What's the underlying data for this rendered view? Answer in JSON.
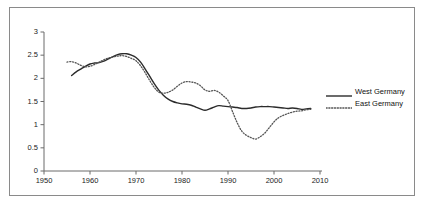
{
  "chart_data": {
    "type": "line",
    "title": "",
    "subtitle": "",
    "xlabel": "",
    "ylabel": "",
    "xlim": [
      1950,
      2010
    ],
    "ylim": [
      0,
      3
    ],
    "grid": false,
    "legend_position": "right",
    "xticks": [
      "1950",
      "1960",
      "1970",
      "1980",
      "1990",
      "2000",
      "2010"
    ],
    "xtick_values": [
      1950,
      1960,
      1970,
      1980,
      1990,
      2000,
      2010
    ],
    "yticks": [
      "0",
      "0.5",
      "1",
      "1.5",
      "2",
      "2.5",
      "3"
    ],
    "ytick_values": [
      0,
      0.5,
      1,
      1.5,
      2,
      2.5,
      3
    ],
    "series": [
      {
        "name": "West Germany",
        "style": "solid",
        "color": "#2b2b2b",
        "x": [
          1956,
          1957,
          1958,
          1959,
          1960,
          1961,
          1962,
          1963,
          1964,
          1965,
          1966,
          1967,
          1968,
          1969,
          1970,
          1971,
          1972,
          1973,
          1974,
          1975,
          1976,
          1977,
          1978,
          1979,
          1980,
          1981,
          1982,
          1983,
          1984,
          1985,
          1986,
          1987,
          1988,
          1989,
          1990,
          1991,
          1992,
          1993,
          1994,
          1995,
          1996,
          1997,
          1998,
          1999,
          2000,
          2001,
          2002,
          2003,
          2004,
          2005,
          2006,
          2007,
          2008
        ],
        "values": [
          2.06,
          2.14,
          2.2,
          2.26,
          2.31,
          2.33,
          2.34,
          2.37,
          2.42,
          2.47,
          2.51,
          2.53,
          2.53,
          2.5,
          2.45,
          2.35,
          2.2,
          2.04,
          1.88,
          1.74,
          1.63,
          1.55,
          1.5,
          1.47,
          1.45,
          1.44,
          1.42,
          1.38,
          1.34,
          1.31,
          1.34,
          1.38,
          1.41,
          1.4,
          1.39,
          1.38,
          1.37,
          1.35,
          1.35,
          1.36,
          1.38,
          1.39,
          1.39,
          1.39,
          1.38,
          1.37,
          1.36,
          1.35,
          1.36,
          1.35,
          1.33,
          1.34,
          1.35
        ]
      },
      {
        "name": "East Germany",
        "style": "dotted",
        "color": "#555555",
        "x": [
          1955,
          1956,
          1957,
          1958,
          1959,
          1960,
          1961,
          1962,
          1963,
          1964,
          1965,
          1966,
          1967,
          1968,
          1969,
          1970,
          1971,
          1972,
          1973,
          1974,
          1975,
          1976,
          1977,
          1978,
          1979,
          1980,
          1981,
          1982,
          1983,
          1984,
          1985,
          1986,
          1987,
          1988,
          1989,
          1990,
          1991,
          1992,
          1993,
          1994,
          1995,
          1996,
          1997,
          1998,
          1999,
          2000,
          2001,
          2002,
          2003,
          2004,
          2005,
          2006,
          2007,
          2008
        ],
        "values": [
          2.35,
          2.36,
          2.33,
          2.28,
          2.25,
          2.26,
          2.3,
          2.35,
          2.4,
          2.44,
          2.46,
          2.48,
          2.49,
          2.47,
          2.43,
          2.38,
          2.27,
          2.12,
          1.95,
          1.8,
          1.7,
          1.68,
          1.7,
          1.75,
          1.83,
          1.9,
          1.93,
          1.92,
          1.9,
          1.84,
          1.75,
          1.72,
          1.74,
          1.7,
          1.62,
          1.52,
          1.28,
          1.04,
          0.86,
          0.77,
          0.72,
          0.69,
          0.74,
          0.82,
          0.94,
          1.06,
          1.15,
          1.2,
          1.24,
          1.27,
          1.29,
          1.3,
          1.32,
          1.33
        ]
      }
    ]
  },
  "legend": {
    "items": [
      {
        "label": "West Germany",
        "style": "solid"
      },
      {
        "label": "East Germany",
        "style": "dotted"
      }
    ]
  }
}
